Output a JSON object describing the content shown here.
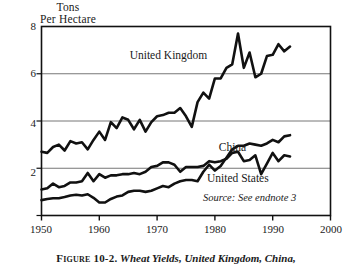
{
  "chart_data": {
    "type": "line",
    "title": "Wheat Yields, United Kingdom, China,",
    "figure_number": "Figure 10-2.",
    "xlabel": "",
    "ylabel": "Tons Per Hectare",
    "ylabel_line1": "Tons",
    "ylabel_line2": "Per Hectare",
    "xlim": [
      1950,
      2000
    ],
    "ylim": [
      0,
      8
    ],
    "xticks": [
      1950,
      1960,
      1970,
      1980,
      1990,
      2000
    ],
    "yticks": [
      0,
      2,
      4,
      6,
      8
    ],
    "ytick_labels": [
      "",
      "2",
      "4",
      "6",
      "8"
    ],
    "grid": "horizontal",
    "legend_position": "inline-annotations",
    "source_note": "Source: See endnote 3",
    "line_color": "#111111",
    "grid_color": "#777777",
    "frame_color": "#111111",
    "series": [
      {
        "name": "United Kingdom",
        "label_x": 1972,
        "label_y": 6.75,
        "x": [
          1950,
          1951,
          1952,
          1953,
          1954,
          1955,
          1956,
          1957,
          1958,
          1959,
          1960,
          1961,
          1962,
          1963,
          1964,
          1965,
          1966,
          1967,
          1968,
          1969,
          1970,
          1971,
          1972,
          1973,
          1974,
          1975,
          1976,
          1977,
          1978,
          1979,
          1980,
          1981,
          1982,
          1983,
          1984,
          1985,
          1986,
          1987,
          1988,
          1989,
          1990,
          1991,
          1992,
          1993
        ],
        "values": [
          2.7,
          2.65,
          2.9,
          3.0,
          2.75,
          3.15,
          3.05,
          3.1,
          2.8,
          3.2,
          3.55,
          3.2,
          3.95,
          3.7,
          4.15,
          4.05,
          3.65,
          4.05,
          3.55,
          3.95,
          4.2,
          4.25,
          4.35,
          4.35,
          4.55,
          4.2,
          3.75,
          4.8,
          5.2,
          4.95,
          5.8,
          5.8,
          6.25,
          6.4,
          7.7,
          6.25,
          6.9,
          5.85,
          6.0,
          6.75,
          6.8,
          7.25,
          6.95,
          7.15
        ]
      },
      {
        "name": "China",
        "label_x": 1983,
        "label_y": 2.85,
        "x": [
          1950,
          1951,
          1952,
          1953,
          1954,
          1955,
          1956,
          1957,
          1958,
          1959,
          1960,
          1961,
          1962,
          1963,
          1964,
          1965,
          1966,
          1967,
          1968,
          1969,
          1970,
          1971,
          1972,
          1973,
          1974,
          1975,
          1976,
          1977,
          1978,
          1979,
          1980,
          1981,
          1982,
          1983,
          1984,
          1985,
          1986,
          1987,
          1988,
          1989,
          1990,
          1991,
          1992,
          1993
        ],
        "values": [
          0.65,
          0.7,
          0.73,
          0.73,
          0.78,
          0.85,
          0.88,
          0.85,
          0.9,
          0.75,
          0.55,
          0.55,
          0.7,
          0.8,
          0.85,
          1.0,
          1.05,
          1.05,
          1.0,
          1.05,
          1.15,
          1.25,
          1.2,
          1.35,
          1.45,
          1.5,
          1.5,
          1.45,
          1.85,
          2.15,
          1.9,
          2.1,
          2.45,
          2.8,
          2.95,
          2.95,
          3.05,
          3.0,
          2.95,
          3.05,
          3.2,
          3.1,
          3.35,
          3.4
        ]
      },
      {
        "name": "United States",
        "label_x": 1984,
        "label_y": 1.55,
        "x": [
          1950,
          1951,
          1952,
          1953,
          1954,
          1955,
          1956,
          1957,
          1958,
          1959,
          1960,
          1961,
          1962,
          1963,
          1964,
          1965,
          1966,
          1967,
          1968,
          1969,
          1970,
          1971,
          1972,
          1973,
          1974,
          1975,
          1976,
          1977,
          1978,
          1979,
          1980,
          1981,
          1982,
          1983,
          1984,
          1985,
          1986,
          1987,
          1988,
          1989,
          1990,
          1991,
          1992,
          1993
        ],
        "values": [
          1.1,
          1.15,
          1.35,
          1.2,
          1.25,
          1.4,
          1.4,
          1.45,
          1.8,
          1.45,
          1.75,
          1.6,
          1.7,
          1.7,
          1.75,
          1.75,
          1.8,
          1.75,
          1.85,
          2.05,
          2.1,
          2.25,
          2.25,
          2.15,
          1.85,
          2.05,
          2.05,
          2.05,
          2.1,
          2.3,
          2.25,
          2.3,
          2.4,
          2.65,
          2.7,
          2.3,
          2.35,
          2.55,
          1.75,
          2.2,
          2.65,
          2.3,
          2.55,
          2.5
        ]
      }
    ]
  }
}
